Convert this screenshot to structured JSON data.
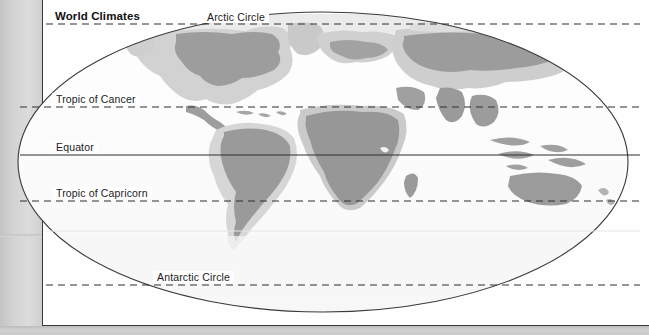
{
  "document": {
    "title": "World Climates",
    "page_background": "#fefefe",
    "scan_background": "#cfcfcf"
  },
  "map": {
    "projection": "elliptical",
    "name": "world-climates-map",
    "ocean_fill": "#fdfdfd",
    "outline_color": "#3a3a3a",
    "land_dark": "#9a9a9a",
    "land_light": "#cfcfcf",
    "land_pale": "#e4e4e4",
    "ellipse": {
      "cx": 323,
      "cy": 162,
      "rx": 305,
      "ry": 150
    }
  },
  "latitude_lines": [
    {
      "id": "arctic-circle",
      "label": "Arctic Circle",
      "style": "dashed",
      "y": 24,
      "label_x": 207,
      "label_y": 11
    },
    {
      "id": "tropic-of-cancer",
      "label": "Tropic of Cancer",
      "style": "dashed",
      "y": 107,
      "label_x": 56,
      "label_y": 93
    },
    {
      "id": "equator",
      "label": "Equator",
      "style": "solid",
      "y": 155,
      "label_x": 56,
      "label_y": 141
    },
    {
      "id": "tropic-of-capricorn",
      "label": "Tropic of Capricorn",
      "style": "dashed",
      "y": 201,
      "label_x": 56,
      "label_y": 187
    },
    {
      "id": "antarctic-circle",
      "label": "Antarctic Circle",
      "style": "dashed",
      "y": 285,
      "label_x": 157,
      "label_y": 271
    }
  ],
  "faint_line": {
    "id": "southern-faint-parallel",
    "y": 231,
    "color": "#e8e8e8"
  },
  "title_position": {
    "x": 52,
    "y": 10
  }
}
